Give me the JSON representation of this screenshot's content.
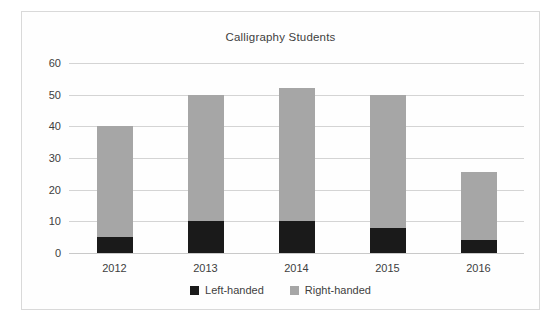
{
  "chart_data": {
    "type": "bar",
    "subtype": "stacked-vertical",
    "title": "Calligraphy Students",
    "xlabel": "",
    "ylabel": "",
    "categories": [
      "2012",
      "2013",
      "2014",
      "2015",
      "2016"
    ],
    "series": [
      {
        "name": "Left-handed",
        "color": "#1a1a1a",
        "values": [
          5,
          10,
          10,
          8,
          4
        ]
      },
      {
        "name": "Right-handed",
        "color": "#a6a6a6",
        "values": [
          35,
          40,
          42,
          42,
          21.5
        ]
      }
    ],
    "totals": [
      40,
      50,
      52,
      50,
      25.5
    ],
    "ylim": [
      0,
      60
    ],
    "yticks": [
      0,
      10,
      20,
      30,
      40,
      50,
      60
    ],
    "ytick_labels": [
      "0",
      "10",
      "20",
      "30",
      "40",
      "50",
      "60"
    ],
    "grid": true,
    "legend_position": "bottom"
  },
  "legend": {
    "items": [
      {
        "label": "Left-handed",
        "color": "#1a1a1a"
      },
      {
        "label": "Right-handed",
        "color": "#a6a6a6"
      }
    ]
  },
  "colors": {
    "background": "#ffffff",
    "frame_border": "#d9d9d9",
    "gridline": "#d4d4d4",
    "axis": "#c9c9c9",
    "text": "#3f3f3f",
    "left_handed": "#1a1a1a",
    "right_handed": "#a6a6a6"
  }
}
